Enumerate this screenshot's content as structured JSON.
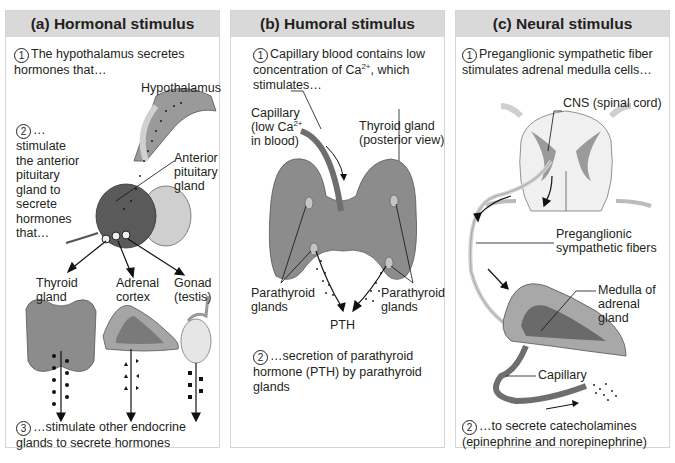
{
  "colors": {
    "header_bg": "#d9d9d9",
    "panel_border": "#d4d4d4",
    "text": "#231f20",
    "gland_gray": "#8c8c8c",
    "capillary": "#6e6e6e"
  },
  "panels": [
    {
      "title": "(a) Hormonal stimulus",
      "steps": [
        {
          "number": "1",
          "text": "The hypothalamus secretes hormones that…"
        },
        {
          "number": "2",
          "text": "…stimulate the anterior pituitary gland to secrete hormones that…"
        },
        {
          "number": "3",
          "text": "…stimulate other endocrine glands to secrete hormones"
        }
      ],
      "labels": {
        "hypothalamus": "Hypothalamus",
        "anterior_pituitary": "Anterior pituitary gland",
        "thyroid": "Thyroid gland",
        "adrenal_cortex": "Adrenal cortex",
        "gonad": "Gonad (testis)"
      }
    },
    {
      "title": "(b) Humoral stimulus",
      "steps": [
        {
          "number": "1",
          "text_before": "Capillary blood contains low concentration of Ca",
          "sup": "2+",
          "text_after": ", which stimulates…"
        },
        {
          "number": "2",
          "text": "…secretion of parathyroid hormone (PTH) by parathyroid glands"
        }
      ],
      "labels": {
        "capillary_line1": "Capillary",
        "capillary_line2_before": "(low Ca",
        "capillary_sup": "2+",
        "capillary_line3": "in blood)",
        "thyroid": "Thyroid gland (posterior view)",
        "parathyroid_left": "Parathyroid glands",
        "parathyroid_right": "Parathyroid glands",
        "pth": "PTH"
      }
    },
    {
      "title": "(c) Neural stimulus",
      "steps": [
        {
          "number": "1",
          "text": "Preganglionic sympathetic fiber stimulates adrenal medulla cells…"
        },
        {
          "number": "2",
          "text": "…to secrete catecholamines (epinephrine and norepinephrine)"
        }
      ],
      "labels": {
        "cns": "CNS (spinal cord)",
        "preganglionic": "Preganglionic sympathetic fibers",
        "medulla": "Medulla of adrenal gland",
        "capillary": "Capillary"
      }
    }
  ]
}
